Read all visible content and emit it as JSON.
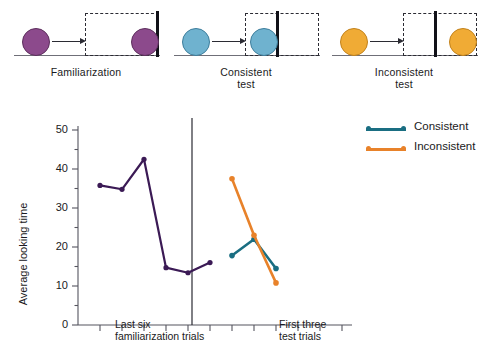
{
  "figure": {
    "diagram": {
      "panels": [
        {
          "id": "familiarization",
          "caption_line1": "Familiarization",
          "caption_line2": "",
          "ball_color": "#8c4a8c",
          "ball_stroke": "#5d2f5d",
          "has_wall": false
        },
        {
          "id": "consistent-test",
          "caption_line1": "Consistent",
          "caption_line2": "test",
          "ball_color": "#6fb2cf",
          "ball_stroke": "#3e7e9c",
          "has_wall": true
        },
        {
          "id": "inconsistent-test",
          "caption_line1": "Inconsistent",
          "caption_line2": "test",
          "ball_color": "#f0ab35",
          "ball_stroke": "#c2821c",
          "has_wall": true
        }
      ]
    }
  },
  "chart_data": {
    "type": "line",
    "title": "",
    "xlabel": "",
    "ylabel": "Average looking time",
    "ylim": [
      0,
      50
    ],
    "yticks": [
      0,
      10,
      20,
      30,
      40,
      50
    ],
    "yticks_minor": [
      5,
      15,
      25,
      35,
      45
    ],
    "grid": false,
    "legend_position": "top-right",
    "x_group_labels": [
      {
        "line1": "Last six",
        "line2": "familiarization trials"
      },
      {
        "line1": "First three",
        "line2": "test trials"
      }
    ],
    "series": [
      {
        "name": "Familiarization",
        "color": "#3b1a55",
        "panel": "left",
        "x": [
          1,
          2,
          3,
          4,
          5,
          6
        ],
        "values": [
          35.8,
          34.8,
          42.5,
          14.7,
          13.4,
          16.0
        ]
      },
      {
        "name": "Consistent",
        "color": "#1a6e82",
        "panel": "right",
        "x": [
          1,
          2,
          3
        ],
        "values": [
          17.8,
          22.0,
          14.5
        ]
      },
      {
        "name": "Inconsistent",
        "color": "#e8822a",
        "panel": "right",
        "x": [
          1,
          2,
          3
        ],
        "values": [
          37.5,
          23.0,
          10.8
        ]
      }
    ],
    "legend": [
      {
        "label": "Consistent",
        "color": "#1a6e82"
      },
      {
        "label": "Inconsistent",
        "color": "#e8822a"
      }
    ]
  }
}
